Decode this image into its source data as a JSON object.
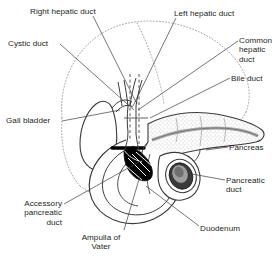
{
  "figure": {
    "background_color": "#ffffff",
    "text_color": "#231f20",
    "line_color": "#3b3b3b",
    "dotted_outline_color": "#8a8a8a",
    "pancreas_fill": "#d8d8d8",
    "duct_fill": "#b5b5b5",
    "ampulla_fill": "#000000"
  },
  "labels": [
    {
      "id": "right-hepatic-duct",
      "name": "Right hepatic duct",
      "text": "Right hepatic duct",
      "align": "left",
      "x": 30,
      "y": 7
    },
    {
      "id": "left-hepatic-duct",
      "name": "Left hepatic duct",
      "text": "Left hepatic duct",
      "align": "left",
      "x": 174,
      "y": 9
    },
    {
      "id": "cystic-duct",
      "name": "Cystic duct",
      "text": "Cystic duct",
      "align": "left",
      "x": 8,
      "y": 39
    },
    {
      "id": "common-hepatic-duct",
      "name": "Common hepatic duct",
      "text": "Common\nhepatic\nduct",
      "align": "left",
      "x": 239,
      "y": 36
    },
    {
      "id": "bile-duct",
      "name": "Bile duct",
      "text": "Bile duct",
      "align": "left",
      "x": 231,
      "y": 74
    },
    {
      "id": "gall-bladder",
      "name": "Gall bladder",
      "text": "Gall bladder",
      "align": "left",
      "x": 6,
      "y": 116
    },
    {
      "id": "pancreas",
      "name": "Pancreas",
      "text": "Pancreas",
      "align": "left",
      "x": 229,
      "y": 143
    },
    {
      "id": "pancreatic-duct",
      "name": "Pancreatic duct",
      "text": "Pancreatic\nduct",
      "align": "left",
      "x": 226,
      "y": 176
    },
    {
      "id": "accessory-pancreatic-duct",
      "name": "Accessory pancreatic duct",
      "text": "Accessory\npancreatic\nduct",
      "align": "right",
      "x": 4,
      "y": 199,
      "width": 58
    },
    {
      "id": "duodenum",
      "name": "Duodenum",
      "text": "Duodenum",
      "align": "left",
      "x": 200,
      "y": 224
    },
    {
      "id": "ampulla-of-vater",
      "name": "Ampulla of Vater",
      "text": "Ampulla of\nVater",
      "align": "center",
      "x": 62,
      "y": 233,
      "width": 78
    }
  ],
  "structures": [
    {
      "id": "liver-outline",
      "name": "liver dotted outline",
      "style": "dotted"
    },
    {
      "id": "gallbladder",
      "name": "gall bladder body",
      "style": "outline"
    },
    {
      "id": "pancreas-body",
      "name": "pancreas body and tail",
      "style": "stippled"
    },
    {
      "id": "duodenum-loop",
      "name": "duodenum C-loop",
      "style": "outline"
    },
    {
      "id": "ampulla",
      "name": "ampulla of Vater cutaway",
      "style": "solid-black"
    },
    {
      "id": "bile-duct-tube",
      "name": "bile duct tube",
      "style": "outline"
    },
    {
      "id": "pancreatic-duct-tube",
      "name": "pancreatic duct tube",
      "style": "gray-fill"
    }
  ]
}
